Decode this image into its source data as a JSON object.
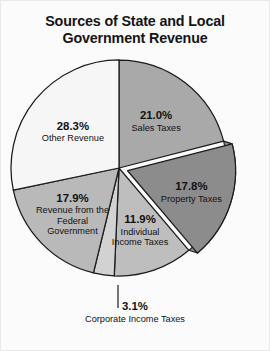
{
  "title": {
    "line1": "Sources of State and Local",
    "line2": "Government Revenue"
  },
  "chart_data": {
    "type": "pie",
    "title": "Sources of State and Local Government Revenue",
    "units": "percent",
    "start_angle_deg": 0,
    "direction": "clockwise",
    "legend": "none",
    "labels_inline": true,
    "categories": [
      "Sales Taxes",
      "Property Taxes",
      "Individual Income Taxes",
      "Corporate Income Taxes",
      "Revenue from the Federal Government",
      "Other Revenue"
    ],
    "values": [
      21.0,
      17.8,
      11.9,
      3.1,
      17.9,
      28.3
    ],
    "slices": [
      {
        "name": "Sales Taxes",
        "value": 21.0,
        "pct_label": "21.0%",
        "name_line1": "Sales Taxes",
        "color": "#a9a9a9",
        "exploded": false
      },
      {
        "name": "Property Taxes",
        "value": 17.8,
        "pct_label": "17.8%",
        "name_line1": "Property Taxes",
        "color": "#8c8c8c",
        "exploded": true
      },
      {
        "name": "Individual Income Taxes",
        "value": 11.9,
        "pct_label": "11.9%",
        "name_line1": "Individual",
        "name_line2": "Income Taxes",
        "color": "#bebebe",
        "exploded": false
      },
      {
        "name": "Corporate Income Taxes",
        "value": 3.1,
        "pct_label": "3.1%",
        "name_line1": "Corporate Income Taxes",
        "color": "#d2d2d2",
        "exploded": false,
        "label_outside": true
      },
      {
        "name": "Revenue from the Federal Government",
        "value": 17.9,
        "pct_label": "17.9%",
        "name_line1": "Revenue from the",
        "name_line2": "Federal",
        "name_line3": "Government",
        "color": "#b9b9b9",
        "exploded": false
      },
      {
        "name": "Other Revenue",
        "value": 28.3,
        "pct_label": "28.3%",
        "name_line1": "Other Revenue",
        "color": "#f6f6f6",
        "exploded": false
      }
    ]
  },
  "colors": {
    "background": "#fbfbfb",
    "outline": "#1b1b1b",
    "text": "#111111",
    "shadow": "#8f8f8f"
  }
}
